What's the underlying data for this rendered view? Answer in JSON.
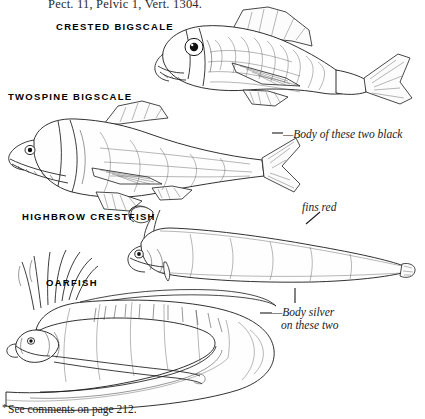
{
  "plate": {
    "header_line": "Pect. 11, Pelvic 1, Vert. 1304.",
    "footnote": "See comments on page 212.",
    "footnote_marker": "*"
  },
  "species": [
    {
      "id": "crested-bigscale",
      "label": "CRESTED BIGSCALE"
    },
    {
      "id": "twospine-bigscale",
      "label": "TWOSPINE BIGSCALE"
    },
    {
      "id": "highbrow-crestfish",
      "label": "HIGHBROW CRESTFISH"
    },
    {
      "id": "oarfish",
      "label": "OARFISH"
    }
  ],
  "annotations": [
    {
      "id": "body-black",
      "text": "—Body of these two black"
    },
    {
      "id": "fins-red",
      "text": "fins red"
    },
    {
      "id": "body-silver-1",
      "text": "—Body silver"
    },
    {
      "id": "body-silver-2",
      "text": "on these two"
    }
  ],
  "colors": {
    "ink": "#1a1a1a",
    "paper": "#ffffff",
    "label": "#000000",
    "annotation": "#1b1b1b"
  }
}
